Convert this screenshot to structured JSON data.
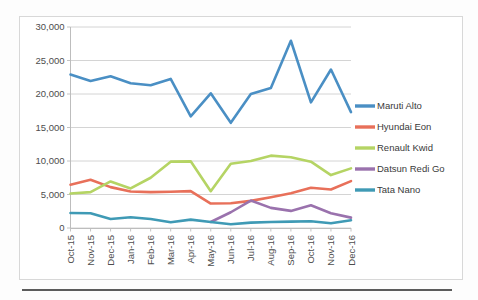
{
  "chart_data": {
    "type": "line",
    "title": "",
    "xlabel": "",
    "ylabel": "",
    "ylim": [
      0,
      30000
    ],
    "ytick_step": 5000,
    "grid": true,
    "legend_position": "right",
    "categories": [
      "Oct-15",
      "Nov-15",
      "Dec-15",
      "Jan-16",
      "Feb-16",
      "Mar-16",
      "Apr-16",
      "May-16",
      "Jun-16",
      "Jul-16",
      "Aug-16",
      "Sep-16",
      "Oct-16",
      "Nov-16",
      "Dec-16"
    ],
    "ytick_labels": [
      "30,000",
      "25,000",
      "20,000",
      "15,000",
      "10,000",
      "5,000",
      "0"
    ],
    "ytick_values": [
      30000,
      25000,
      20000,
      15000,
      10000,
      5000,
      0
    ],
    "series": [
      {
        "name": "Maruti Alto",
        "color": "#4A8FC4",
        "values": [
          22900,
          21950,
          22650,
          21600,
          21300,
          22250,
          16650,
          20100,
          15700,
          20000,
          20900,
          27950,
          18750,
          23650,
          17300
        ]
      },
      {
        "name": "Hyundai Eon",
        "color": "#E8705A",
        "values": [
          6450,
          7200,
          6100,
          5450,
          5350,
          5400,
          5500,
          3650,
          3700,
          4050,
          4600,
          5200,
          6000,
          5750,
          7000
        ]
      },
      {
        "name": "Renault Kwid",
        "color": "#B5D464",
        "values": [
          5150,
          5350,
          6950,
          5900,
          7500,
          9900,
          9950,
          5500,
          9600,
          10000,
          10800,
          10550,
          9900,
          7900,
          8900
        ]
      },
      {
        "name": "Datsun Redi Go",
        "color": "#9A72AD",
        "values": [
          null,
          null,
          null,
          null,
          null,
          null,
          null,
          900,
          2350,
          4100,
          3000,
          2550,
          3400,
          2200,
          1550
        ]
      },
      {
        "name": "Tata Nano",
        "color": "#3F9AB5",
        "values": [
          2250,
          2200,
          1350,
          1600,
          1350,
          850,
          1250,
          900,
          550,
          800,
          900,
          950,
          1000,
          700,
          1150
        ]
      }
    ]
  },
  "legend": {
    "items": [
      {
        "label": "Maruti Alto",
        "color": "#4A8FC4"
      },
      {
        "label": "Hyundai Eon",
        "color": "#E8705A"
      },
      {
        "label": "Renault Kwid",
        "color": "#B5D464"
      },
      {
        "label": "Datsun Redi Go",
        "color": "#9A72AD"
      },
      {
        "label": "Tata Nano",
        "color": "#3F9AB5"
      }
    ]
  }
}
